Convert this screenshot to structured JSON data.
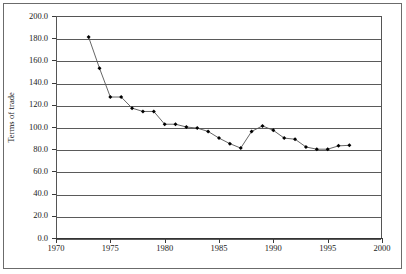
{
  "chart_data": {
    "type": "line",
    "title": "",
    "subtitle": "",
    "xlabel": "",
    "ylabel": "Terms of trade",
    "xlim": [
      1970,
      2000
    ],
    "ylim": [
      0,
      200
    ],
    "grid": true,
    "legend": "none",
    "marker": "filled-diamond",
    "line_color": "#555555",
    "marker_color": "#000000",
    "x_ticks": [
      "1970",
      "1975",
      "1980",
      "1985",
      "1990",
      "1995",
      "2000"
    ],
    "x_tick_values": [
      1970,
      1975,
      1980,
      1985,
      1990,
      1995,
      2000
    ],
    "y_ticks": [
      "0.0",
      "20.0",
      "40.0",
      "60.0",
      "80.0",
      "100.0",
      "120.0",
      "140.0",
      "160.0",
      "180.0",
      "200.0"
    ],
    "y_tick_values": [
      0,
      20,
      40,
      60,
      80,
      100,
      120,
      140,
      160,
      180,
      200
    ],
    "series": [
      {
        "name": "Terms of trade",
        "x": [
          1973,
          1974,
          1975,
          1976,
          1977,
          1978,
          1979,
          1980,
          1981,
          1982,
          1983,
          1984,
          1985,
          1986,
          1987,
          1988,
          1989,
          1990,
          1991,
          1992,
          1993,
          1994,
          1995,
          1996,
          1997
        ],
        "values": [
          181.0,
          153.0,
          127.0,
          127.0,
          117.0,
          114.0,
          114.0,
          102.5,
          102.5,
          100.0,
          99.0,
          96.0,
          90.0,
          85.0,
          81.0,
          96.0,
          101.0,
          97.0,
          90.0,
          89.0,
          82.0,
          80.0,
          80.0,
          83.0,
          83.5
        ]
      }
    ]
  },
  "axes": {
    "y_title": "Terms of trade"
  }
}
